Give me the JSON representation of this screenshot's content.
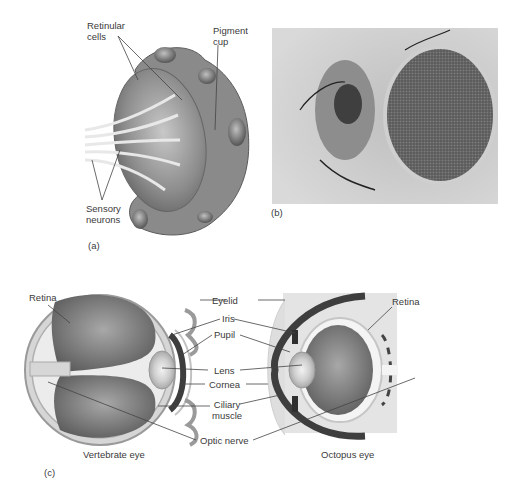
{
  "panel_a": {
    "caption": "(a)",
    "labels": {
      "retinular_cells_1": "Retinular",
      "retinular_cells_2": "cells",
      "pigment_cup_1": "Pigment",
      "pigment_cup_2": "cup",
      "sensory_neurons_1": "Sensory",
      "sensory_neurons_2": "neurons"
    }
  },
  "panel_b": {
    "caption": "(b)",
    "description": "Photograph of insect compound eye"
  },
  "panel_c": {
    "caption": "(c)",
    "left_title": "Vertebrate eye",
    "right_title": "Octopus eye",
    "labels": {
      "retina_left": "Retina",
      "retina_right": "Retina",
      "eyelid": "Eyelid",
      "iris": "Iris",
      "pupil": "Pupil",
      "lens": "Lens",
      "cornea": "Cornea",
      "ciliary_1": "Ciliary",
      "ciliary_2": "muscle",
      "optic_nerve": "Optic nerve"
    }
  },
  "colors": {
    "tissue_dark": "#7a7a7a",
    "tissue_mid": "#9a9a9a",
    "tissue_light": "#d8d8d8",
    "background_panel": "#e6e6e6",
    "line": "#444444"
  }
}
